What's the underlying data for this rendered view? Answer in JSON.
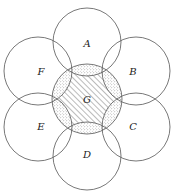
{
  "diagram": {
    "type": "overlapping-circles",
    "center": {
      "x": 87,
      "y": 99
    },
    "central_circle": {
      "label": "G",
      "r": 35,
      "fill_pattern": "hatched"
    },
    "outer_circle_radius": 34,
    "outer_circles": [
      {
        "label": "A",
        "cx": 87,
        "cy": 42,
        "lx": 87,
        "ly": 47
      },
      {
        "label": "B",
        "cx": 136,
        "cy": 71,
        "lx": 133,
        "ly": 75
      },
      {
        "label": "C",
        "cx": 136,
        "cy": 127,
        "lx": 133,
        "ly": 130
      },
      {
        "label": "D",
        "cx": 87,
        "cy": 156,
        "lx": 87,
        "ly": 158
      },
      {
        "label": "E",
        "cx": 38,
        "cy": 127,
        "lx": 41,
        "ly": 130
      },
      {
        "label": "F",
        "cx": 38,
        "cy": 71,
        "lx": 41,
        "ly": 75
      }
    ],
    "overlap_fill_pattern": "dotted",
    "colors": {
      "stroke": "#555555",
      "dots": "#777777",
      "hatch": "#555555",
      "text": "#222222"
    }
  }
}
